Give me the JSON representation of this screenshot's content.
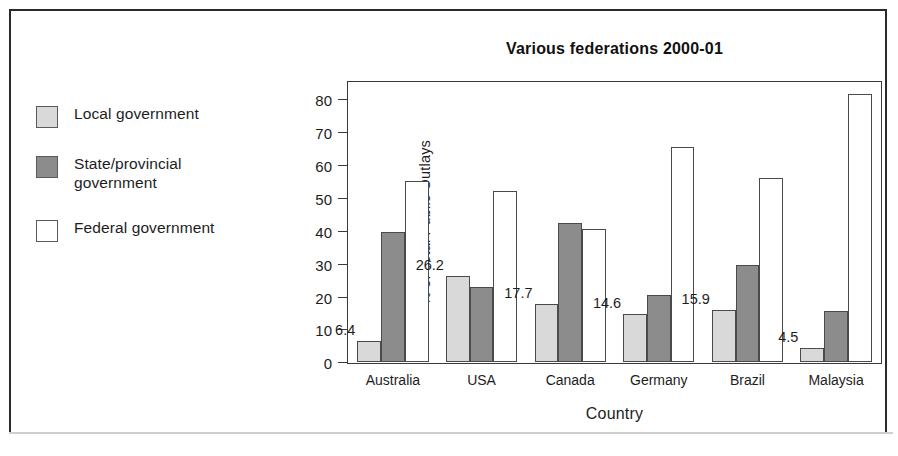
{
  "chart_data": {
    "type": "bar",
    "title": "Various federations 2000-01",
    "xlabel": "Country",
    "ylabel": "% of Total Public Outlays",
    "categories": [
      "Australia",
      "USA",
      "Canada",
      "Germany",
      "Brazil",
      "Malaysia"
    ],
    "series": [
      {
        "name": "Local government",
        "color": "#d9d9d9",
        "values": [
          6.4,
          26.2,
          17.7,
          14.6,
          15.9,
          4.5
        ],
        "labels": [
          "6.4",
          "26.2",
          "17.7",
          "14.6",
          "15.9",
          "4.5"
        ]
      },
      {
        "name": "State/provincial government",
        "color": "#8c8c8c",
        "values": [
          39.5,
          23.0,
          42.5,
          20.5,
          29.5,
          15.5
        ],
        "labels": [
          "",
          "",
          "",
          "",
          "",
          ""
        ]
      },
      {
        "name": "Federal government",
        "color": "#ffffff",
        "values": [
          55.0,
          52.0,
          40.5,
          65.5,
          56.0,
          81.5
        ],
        "labels": [
          "",
          "",
          "",
          "",
          "",
          ""
        ]
      }
    ],
    "ylim": [
      0,
      85
    ],
    "yticks": [
      0,
      10,
      20,
      30,
      40,
      50,
      60,
      70,
      80
    ],
    "ytick_labels": [
      "0",
      "10",
      "20",
      "30",
      "40",
      "50",
      "60",
      "70",
      "80"
    ],
    "grid": false,
    "legend_position": "left-outside"
  },
  "legend": {
    "items": [
      {
        "label": "Local\ngovernment",
        "swatch": "#d9d9d9"
      },
      {
        "label": "State/provincial\ngovernment",
        "swatch": "#8c8c8c"
      },
      {
        "label": "Federal\ngovernment",
        "swatch": "#ffffff"
      }
    ]
  }
}
